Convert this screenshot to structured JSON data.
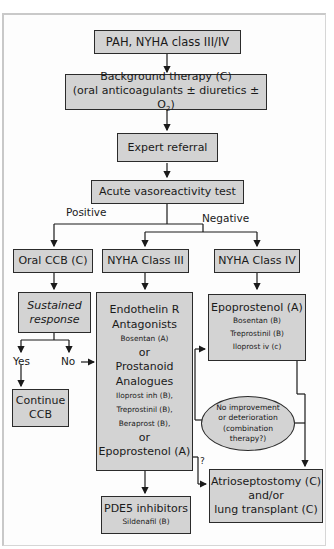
{
  "flowchart": {
    "nodes": {
      "start": {
        "label": "PAH, NYHA class III/IV"
      },
      "background": {
        "line1": "Background therapy (C)",
        "line2_prefix": "(oral anticoagulants ± diuretics ± O",
        "line2_sub": "2",
        "line2_suffix": ")"
      },
      "referral": {
        "label": "Expert referral"
      },
      "vasotest": {
        "label": "Acute vasoreactivity test"
      },
      "oral_ccb": {
        "label": "Oral CCB (C)"
      },
      "nyha3": {
        "label": "NYHA Class III"
      },
      "nyha4": {
        "label": "NYHA Class IV"
      },
      "sustained": {
        "line1": "Sustained",
        "line2": "response"
      },
      "continue_ccb": {
        "line1": "Continue",
        "line2": "CCB"
      },
      "class3_therapy": {
        "heading1": "Endothelin R",
        "heading2": "Antagonists",
        "item1": "Bosentan (A)",
        "or1": "or",
        "heading3": "Prostanoid",
        "heading4": "Analogues",
        "item2": "Iloprost inh (B),",
        "item3": "Treprostinil (B),",
        "item4": "Beraprost (B),",
        "or2": "or",
        "heading5": "Epoprostenol (A)"
      },
      "class4_therapy": {
        "heading": "Epoprostenol (A)",
        "item1": "Bosentan (B)",
        "item2": "Treprostinil (B)",
        "item3": "Iloprost iv (c)"
      },
      "no_improvement": {
        "line1": "No improvement",
        "line2": "or deterioration",
        "line3": "(combination",
        "line4": "therapy?)"
      },
      "atrioseptostomy": {
        "line1": "Atrioseptostomy (C)",
        "line2": "and/or",
        "line3": "lung transplant (C)"
      },
      "pde5": {
        "line1": "PDE5 inhibitors",
        "line2": "Sildenafil (B)"
      }
    },
    "edge_labels": {
      "positive": "Positive",
      "negative": "Negative",
      "yes": "Yes",
      "no": "No",
      "question": "?"
    },
    "colors": {
      "box_fill": "#d3d3d3",
      "border": "#2b2b2b",
      "frame": "#c9c9c9"
    }
  }
}
